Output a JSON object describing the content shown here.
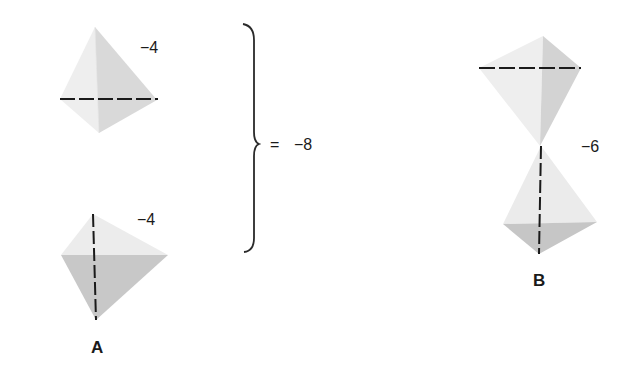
{
  "diagram": {
    "groupA": {
      "label": "A",
      "top": {
        "value": "−4",
        "dash_axis": "horizontal"
      },
      "bottom": {
        "value": "−4",
        "dash_axis": "vertical"
      },
      "sum": {
        "equals": "=",
        "value": "−8"
      }
    },
    "groupB": {
      "label": "B",
      "value": "−6",
      "top_dash_axis": "horizontal",
      "bottom_dash_axis": "vertical"
    },
    "colors": {
      "face_light": "#eeeeee",
      "face_mid": "#d9d9d9",
      "face_dark": "#c6c6c6",
      "dash": "#1a1a1a",
      "brace": "#2a2a2a"
    }
  }
}
